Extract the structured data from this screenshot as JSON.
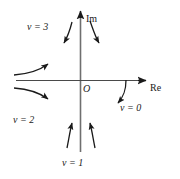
{
  "figure": {
    "type": "complex-plane-flow-diagram",
    "background_color": "#ffffff",
    "stroke_color": "#1a1a1a"
  },
  "axes": {
    "imaginary": {
      "label": "Im",
      "orientation": "vertical",
      "arrow_at": "top"
    },
    "real": {
      "label": "Re",
      "orientation": "horizontal",
      "arrow_at": "right"
    },
    "origin": {
      "label": "O"
    }
  },
  "annotations": [
    {
      "id": "v3",
      "label": "v = 3",
      "region": "upper-left",
      "near": "positive-imaginary-axis"
    },
    {
      "id": "v2",
      "label": "v = 2",
      "region": "lower-left",
      "near": "negative-real-axis"
    },
    {
      "id": "v1",
      "label": "v = 1",
      "region": "bottom",
      "near": "negative-imaginary-axis"
    },
    {
      "id": "v0",
      "label": "v = 0",
      "region": "lower-right",
      "near": "positive-real-axis"
    }
  ],
  "flow_arrows": [
    {
      "id": "arrow-upper-left-down",
      "direction": "down-left",
      "quadrant": "II"
    },
    {
      "id": "arrow-upper-right-down",
      "direction": "down-right",
      "quadrant": "I"
    },
    {
      "id": "arrow-left-upper-right",
      "direction": "right-up",
      "quadrant": "II"
    },
    {
      "id": "arrow-left-lower-right",
      "direction": "right-down",
      "quadrant": "III"
    },
    {
      "id": "arrow-right-down-left",
      "direction": "down-left",
      "quadrant": "IV"
    },
    {
      "id": "arrow-bottom-left-up",
      "direction": "up",
      "quadrant": "III"
    },
    {
      "id": "arrow-bottom-right-up",
      "direction": "up",
      "quadrant": "IV"
    }
  ]
}
